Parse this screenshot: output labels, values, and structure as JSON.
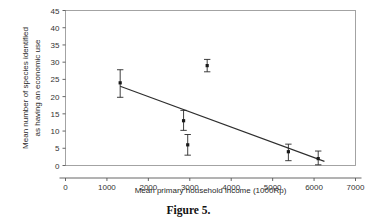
{
  "figure": {
    "caption": "Figure 5."
  },
  "chart_data": {
    "type": "scatter",
    "title": "",
    "xlabel": "Mean primary household income (1000Rp)",
    "ylabel": "Mean number of species identified as having an economic use",
    "ylabel_line1": "Mean number of species identified",
    "ylabel_line2": "as having an economic use",
    "xlim": [
      0,
      7000
    ],
    "ylim": [
      0,
      45
    ],
    "xticks": [
      0,
      1000,
      2000,
      3000,
      4000,
      5000,
      6000,
      7000
    ],
    "yticks": [
      0,
      5,
      10,
      15,
      20,
      25,
      30,
      35,
      40,
      45
    ],
    "xtick_labels": [
      "0",
      "1000",
      "2000",
      "3000",
      "4000",
      "5000",
      "6000",
      "7000"
    ],
    "ytick_labels": [
      "0",
      "5",
      "10",
      "15",
      "20",
      "25",
      "30",
      "35",
      "40",
      "45"
    ],
    "grid": false,
    "legend": null,
    "points": [
      {
        "x": 1320,
        "y": 24.0,
        "yerr_low": 4.2,
        "yerr_high": 3.8
      },
      {
        "x": 2850,
        "y": 13.0,
        "yerr_low": 2.8,
        "yerr_high": 3.0
      },
      {
        "x": 2950,
        "y": 6.0,
        "yerr_low": 3.0,
        "yerr_high": 3.0
      },
      {
        "x": 3420,
        "y": 29.0,
        "yerr_low": 1.8,
        "yerr_high": 1.8
      },
      {
        "x": 5380,
        "y": 4.0,
        "yerr_low": 2.6,
        "yerr_high": 2.2
      },
      {
        "x": 6100,
        "y": 2.0,
        "yerr_low": 1.8,
        "yerr_high": 2.2
      }
    ],
    "trend_line": {
      "x_start": 1320,
      "y_start": 23.0,
      "x_end": 6250,
      "y_end": 1.2
    },
    "colors": {
      "marker": "#1a1a1a",
      "line": "#2e2e2e",
      "frame": "#9a9a9a",
      "text": "#2a2a2a"
    }
  }
}
